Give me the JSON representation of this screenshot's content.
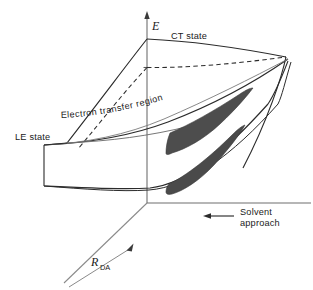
{
  "figure": {
    "kind": "3d-potential-energy-surface-diagram",
    "background_color": "#ffffff",
    "line_color": "#2b2b2b",
    "axis_color": "#6f6f6f",
    "shade_color": "#4d4d4d",
    "text_color": "#1a1a1a"
  },
  "axes": {
    "energy": {
      "label": "E",
      "orientation": "vertical",
      "arrow": "up",
      "name": "energy-axis"
    },
    "solvent": {
      "label_line1": "Solvent",
      "label_line2": "approach",
      "orientation": "horizontal",
      "arrow": "left",
      "name": "solvent-axis"
    },
    "distance": {
      "label_main": "R",
      "label_sub": "DA",
      "orientation": "diagonal-depth",
      "arrow": "up-right",
      "name": "donor-acceptor-distance-axis"
    }
  },
  "annotations": {
    "ct_state": "CT state",
    "le_state": "LE state",
    "electron_transfer_region": "Electron  transfer  region"
  },
  "surfaces": [
    {
      "id": "ct-surface",
      "label": "CT state",
      "style": "solid-outline"
    },
    {
      "id": "le-surface",
      "label": "LE state",
      "style": "solid-outline"
    },
    {
      "id": "lower-surface",
      "label": "",
      "style": "solid-outline"
    }
  ],
  "shaded_regions": [
    {
      "id": "upper-crescent",
      "fill": "#4d4d4d"
    },
    {
      "id": "lower-crescent",
      "fill": "#4a4a4a"
    }
  ]
}
